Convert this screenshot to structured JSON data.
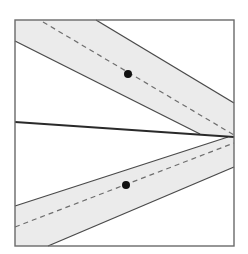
{
  "diagram": {
    "width": 248,
    "height": 254,
    "colors": {
      "background": "#ffffff",
      "frame": "#6a6a6a",
      "band_fill": "#ebebeb",
      "band_edge": "#4a4a4a",
      "dashed": "#6e6e6e",
      "solid_line": "#2a2a2a",
      "dot": "#111111"
    },
    "frame": {
      "x": 15,
      "y": 20,
      "w": 219,
      "h": 226
    },
    "upper_band": {
      "polygon": "15,20 96,20 234,103 234,136 200,134 15,41",
      "upper_edge": {
        "x1": 96,
        "y1": 20,
        "x2": 234,
        "y2": 103
      },
      "lower_edge": {
        "x1": 15,
        "y1": 41,
        "x2": 200,
        "y2": 134
      },
      "centerline": {
        "x1": 43,
        "y1": 22,
        "x2": 234,
        "y2": 135
      },
      "dot": {
        "cx": 128,
        "cy": 74,
        "r": 4
      }
    },
    "lower_band": {
      "polygon": "15,206 228,137 234,137 234,167 48,246 15,246",
      "upper_edge": {
        "x1": 15,
        "y1": 206,
        "x2": 228,
        "y2": 137
      },
      "lower_edge": {
        "x1": 48,
        "y1": 246,
        "x2": 234,
        "y2": 167
      },
      "centerline": {
        "x1": 15,
        "y1": 227,
        "x2": 234,
        "y2": 143
      },
      "dot": {
        "cx": 126,
        "cy": 185,
        "r": 4
      }
    },
    "solid_line": {
      "x1": 15,
      "y1": 122,
      "x2": 234,
      "y2": 137
    }
  }
}
